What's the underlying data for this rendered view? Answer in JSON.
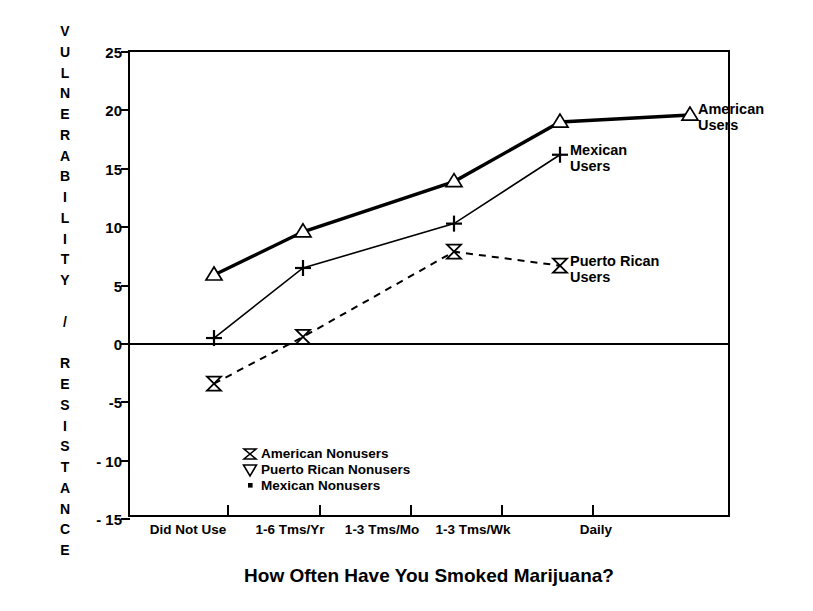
{
  "chart_data": {
    "type": "line",
    "title": "",
    "xlabel": "How Often Have You Smoked Marijuana?",
    "ylabel": "VULNERABILITY / RESISTANCE",
    "categories": [
      "Did Not Use",
      "1-6 Tms/Yr",
      "1-3 Tms/Mo",
      "1-3 Tms/Wk",
      "Daily"
    ],
    "ylim": [
      -15,
      25
    ],
    "yticks": [
      25,
      20,
      15,
      10,
      5,
      0,
      -5,
      -10,
      -15
    ],
    "ytick_labels": [
      "25",
      "20",
      "15",
      "10",
      "5",
      "0",
      "-5",
      "- 10",
      "- 15"
    ],
    "grid": false,
    "legend_position": "inline-right-of-series",
    "series": [
      {
        "name": "American Users",
        "marker": "triangle-up-open",
        "line_style": "solid-thick",
        "values": [
          5.9,
          9.6,
          13.9,
          19.0,
          19.6
        ]
      },
      {
        "name": "Mexican Users",
        "marker": "plus",
        "line_style": "solid-thin",
        "values": [
          0.5,
          6.5,
          10.3,
          16.2,
          null
        ]
      },
      {
        "name": "Puerto Rican Users",
        "marker": "bowtie-open",
        "line_style": "dotted",
        "values": [
          -3.4,
          0.6,
          7.9,
          6.7,
          null
        ]
      }
    ],
    "annotations": [
      {
        "name": "American Nonusers",
        "marker": "bowtie-open",
        "value": -9.5
      },
      {
        "name": "Puerto Rican Nonusers",
        "marker": "triangle-down-open",
        "value": -10.3
      },
      {
        "name": "Mexican Nonusers",
        "marker": "small-square",
        "value": -11.2
      }
    ]
  },
  "axis": {
    "y_title_letters": [
      "V",
      "U",
      "L",
      "N",
      "E",
      "R",
      "A",
      "B",
      "I",
      "L",
      "I",
      "T",
      "Y",
      "",
      "/",
      "",
      "R",
      "E",
      "S",
      "I",
      "S",
      "T",
      "A",
      "N",
      "C",
      "E"
    ],
    "y_title_text": "VULNERABILITY / RESISTANCE",
    "x_title": "How Often Have You Smoked Marijuana?"
  },
  "series_labels": {
    "american_line1": "American",
    "american_line2": "Users",
    "mexican_line1": "Mexican",
    "mexican_line2": "Users",
    "puertorican_line1": "Puerto Rican",
    "puertorican_line2": "Users"
  },
  "legend": {
    "items": [
      {
        "label": "American Nonusers"
      },
      {
        "label": "Puerto Rican Nonusers"
      },
      {
        "label": "Mexican Nonusers"
      }
    ]
  },
  "colors": {
    "ink": "#000000",
    "background": "#ffffff"
  }
}
